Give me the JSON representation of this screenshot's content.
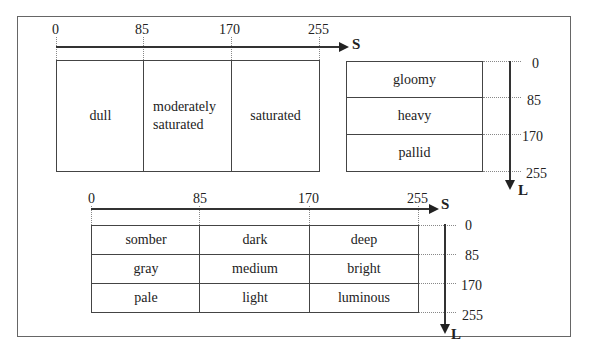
{
  "diagram_top_left": {
    "axis_label": "S",
    "ticks": [
      "0",
      "85",
      "170",
      "255"
    ],
    "cells": [
      "dull",
      "moderately saturated",
      "saturated"
    ],
    "cell_lines": [
      [
        "dull"
      ],
      [
        "moderately",
        "saturated"
      ],
      [
        "saturated"
      ]
    ]
  },
  "diagram_top_right": {
    "axis_label": "L",
    "ticks": [
      "0",
      "85",
      "170",
      "255"
    ],
    "cells": [
      "gloomy",
      "heavy",
      "pallid"
    ]
  },
  "diagram_bottom": {
    "s_axis_label": "S",
    "l_axis_label": "L",
    "s_ticks": [
      "0",
      "85",
      "170",
      "255"
    ],
    "l_ticks": [
      "0",
      "85",
      "170",
      "255"
    ],
    "rows": [
      [
        "somber",
        "dark",
        "deep"
      ],
      [
        "gray",
        "medium",
        "bright"
      ],
      [
        "pale",
        "light",
        "luminous"
      ]
    ]
  }
}
